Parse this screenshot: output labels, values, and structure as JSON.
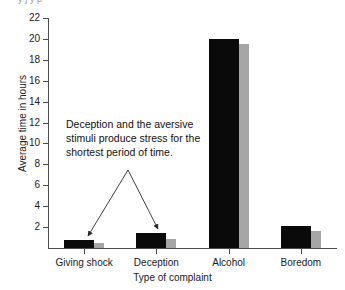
{
  "top_cut_text": "y j        y    p",
  "chart_data": {
    "type": "bar",
    "title": "",
    "xlabel": "Type of complaint",
    "ylabel": "Average time in hours",
    "categories": [
      "Giving shock",
      "Deception",
      "Alcohol",
      "Boredom"
    ],
    "series": [
      {
        "name": "black",
        "color": "#0a0a0a",
        "values": [
          0.8,
          1.4,
          20.0,
          2.1
        ]
      },
      {
        "name": "gray",
        "color": "#a6a6a6",
        "values": [
          0.5,
          0.9,
          19.5,
          1.6
        ]
      }
    ],
    "ylim": [
      0,
      22
    ],
    "yticks": [
      2,
      4,
      6,
      8,
      10,
      12,
      14,
      16,
      18,
      20,
      22
    ],
    "ytick_labels": [
      "2",
      "4",
      "6",
      "8",
      "10",
      "12",
      "14",
      "16",
      "18",
      "20",
      "22"
    ],
    "grid": false,
    "legend": "none",
    "annotations": [
      {
        "text": "Deception and the aversive stimuli produce stress for the shortest period of time.",
        "line1": "Deception and the aversive",
        "line2": "stimuli produce stress for the",
        "line3": "shortest period of time.",
        "points_to": [
          "Giving shock",
          "Deception"
        ]
      }
    ]
  },
  "axis": {
    "y_title": "Average time in hours",
    "x_title": "Type of complaint"
  }
}
